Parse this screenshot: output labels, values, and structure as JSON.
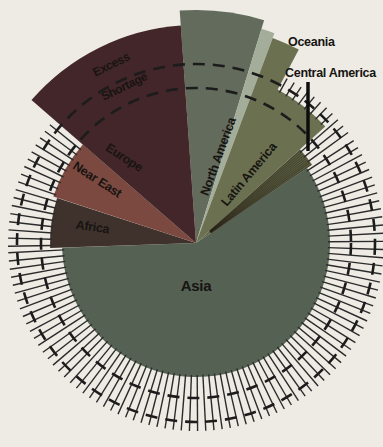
{
  "chart_data": {
    "type": "pie",
    "variant": "variable-radius-pie",
    "title": "",
    "legend_position": "none",
    "background_color": "#edebe4",
    "center": {
      "x": 196,
      "y": 243
    },
    "reference_circles": {
      "inner_radius": 155,
      "outer_radius": 179,
      "color": "#1c1c1c",
      "stroke_width": 2.6,
      "dash_pattern": "12 8",
      "excess_label": "Excess",
      "shortage_label": "Shortage",
      "excess_transform": "translate(113,68) rotate(-26)",
      "shortage_transform": "translate(126,90) rotate(-26)"
    },
    "hatch": {
      "outer_radius": 188,
      "step_deg": 2.5,
      "color": "#2b2b2b",
      "stroke_width": 1.4
    },
    "segments": [
      {
        "label": "North America",
        "start": -4,
        "end": 17,
        "steps": [
          {
            "start": -4,
            "end": 17,
            "radius": 233
          }
        ],
        "color": "#636b5c",
        "status": "excess",
        "hatched": false,
        "texture": false,
        "label_transform": "translate(222,158) rotate(-70)",
        "label_class": "seg-label"
      },
      {
        "label": "Oceania",
        "start": 17,
        "end": 20.5,
        "steps": [
          {
            "start": 17,
            "end": 20.5,
            "radius": 224
          }
        ],
        "color": "#a4ad9a",
        "status": "excess",
        "hatched": false,
        "texture": false,
        "label_transform": "",
        "label_class": ""
      },
      {
        "label": "Latin America",
        "start": 20.5,
        "end": 48,
        "steps": [
          {
            "start": 20.5,
            "end": 28,
            "radius": 219
          },
          {
            "start": 28,
            "end": 48,
            "radius": 174
          }
        ],
        "color": "#6b7150",
        "status": "shortage",
        "hatched": true,
        "texture": false,
        "label_transform": "translate(252,177) rotate(-50)",
        "label_class": "seg-label"
      },
      {
        "label": "Central America",
        "start": 48,
        "end": 56,
        "steps": [
          {
            "start": 48,
            "end": 56,
            "radius": 140
          }
        ],
        "color": "#626849",
        "status": "shortage",
        "hatched": true,
        "texture": true,
        "label_transform": "",
        "label_class": ""
      },
      {
        "label": "Asia",
        "start": 56,
        "end": 268,
        "steps": [
          {
            "start": 56,
            "end": 268,
            "radius": 134
          }
        ],
        "color": "#556153",
        "status": "shortage",
        "hatched": true,
        "texture": false,
        "label_transform": "translate(196,291)",
        "label_class": "seg-label-big"
      },
      {
        "label": "Africa",
        "start": 268,
        "end": 288,
        "steps": [
          {
            "start": 268,
            "end": 288,
            "radius": 146
          }
        ],
        "color": "#3f322c",
        "status": "shortage",
        "hatched": true,
        "texture": false,
        "label_transform": "translate(92,231) rotate(8)",
        "label_class": "seg-label"
      },
      {
        "label": "Near East",
        "start": 288,
        "end": 311,
        "steps": [
          {
            "start": 288,
            "end": 311,
            "radius": 150
          }
        ],
        "color": "#7b493f",
        "status": "shortage",
        "hatched": true,
        "texture": false,
        "label_transform": "translate(95,183) rotate(33)",
        "label_class": "seg-label"
      },
      {
        "label": "Europe",
        "start": 311,
        "end": 356,
        "steps": [
          {
            "start": 311,
            "end": 356,
            "radius": 218
          }
        ],
        "color": "#432629",
        "status": "excess",
        "hatched": false,
        "texture": false,
        "label_transform": "translate(122,161) rotate(33)",
        "label_class": "seg-label"
      }
    ],
    "callouts": {
      "oceania": {
        "label": "Oceania",
        "x": 288,
        "y": 46
      },
      "central_america": {
        "label": "Central America",
        "x": 285,
        "y": 77,
        "pointer": {
          "x1": 308,
          "y1": 82,
          "x2": 308,
          "y2": 151,
          "width": 3.5,
          "color": "#0d0d0d"
        }
      }
    }
  }
}
